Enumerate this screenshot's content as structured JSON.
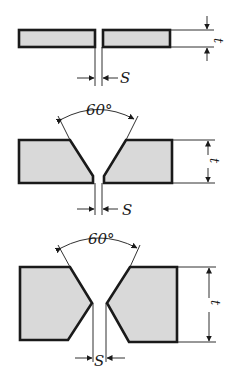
{
  "joints": [
    {
      "type": "square-butt",
      "gap_label": "S",
      "thickness_label": "t"
    },
    {
      "type": "single-V",
      "angle_label": "60°",
      "gap_label": "S",
      "thickness_label": "t"
    },
    {
      "type": "double-V",
      "angle_label": "60°",
      "gap_label": "S",
      "thickness_label": "t"
    }
  ],
  "colors": {
    "ink": "#1a1a1a",
    "fill": "#d9d9d9",
    "background": "#ffffff"
  }
}
